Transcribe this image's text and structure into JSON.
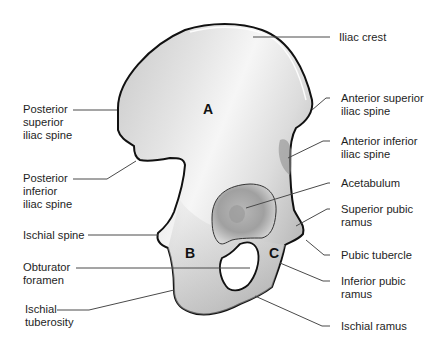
{
  "diagram": {
    "regions": [
      {
        "letter": "A"
      },
      {
        "letter": "B"
      },
      {
        "letter": "C"
      }
    ],
    "labels_left": [
      {
        "text": "Posterior\nsuperior\niliac spine"
      },
      {
        "text": "Posterior\ninferior\niliac spine"
      },
      {
        "text": "Ischial spine"
      },
      {
        "text": "Obturator\nforamen"
      },
      {
        "text": "Ischial\ntuberosity"
      }
    ],
    "labels_right": [
      {
        "text": "Iliac crest"
      },
      {
        "text": "Anterior superior\niliac spine"
      },
      {
        "text": "Anterior inferior\niliac spine"
      },
      {
        "text": "Acetabulum"
      },
      {
        "text": "Superior pubic\nramus"
      },
      {
        "text": "Pubic tubercle"
      },
      {
        "text": "Inferior pubic\nramus"
      },
      {
        "text": "Ischial ramus"
      }
    ]
  },
  "colors": {
    "bone_light": "#f2f2f2",
    "bone_mid": "#cfcfcf",
    "bone_dark": "#8c8c8c",
    "outline": "#111111",
    "leader": "#4a4a4a",
    "text": "#1e1e1e"
  }
}
